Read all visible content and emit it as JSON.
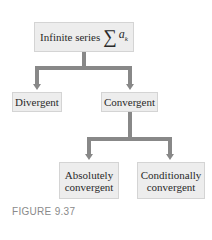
{
  "root": {
    "label": "Infinite series",
    "symbol": "∑",
    "term": "a",
    "subscript": "k"
  },
  "level1": {
    "left": "Divergent",
    "right": "Convergent"
  },
  "level2": {
    "left_line1": "Absolutely",
    "left_line2": "convergent",
    "right_line1": "Conditionally",
    "right_line2": "convergent"
  },
  "caption": "FIGURE 9.37",
  "colors": {
    "box_fill": "#ededed",
    "connector": "#888888",
    "caption": "#8a8a8a"
  }
}
